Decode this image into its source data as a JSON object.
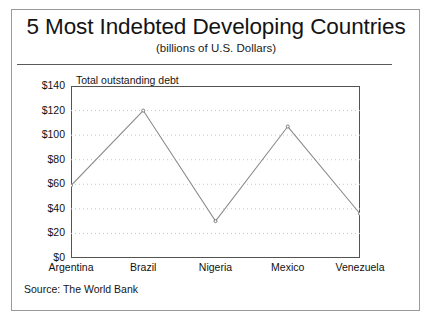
{
  "figure": {
    "title": "5 Most Indebted Developing Countries",
    "subtitle": "(billions of U.S. Dollars)",
    "series_caption": "Total outstanding debt",
    "source": "Source: The World Bank"
  },
  "colors": {
    "frame": "#9a9a9a",
    "plot_border": "#53534f",
    "line": "#8a8a8a",
    "gridline": "#c9c9c9",
    "text": "#141414",
    "background": "#ffffff"
  },
  "chart_data": {
    "type": "line",
    "title": "5 Most Indebted Developing Countries",
    "subtitle": "(billions of U.S. Dollars)",
    "xlabel": "",
    "ylabel": "",
    "series_name": "Total outstanding debt",
    "categories": [
      "Argentina",
      "Brazil",
      "Nigeria",
      "Mexico",
      "Venezuela"
    ],
    "values": [
      59,
      120,
      30,
      107,
      36
    ],
    "ylim": [
      0,
      140
    ],
    "yticks": [
      0,
      20,
      40,
      60,
      80,
      100,
      120,
      140
    ],
    "ytick_labels": [
      "$0",
      "$20",
      "$40",
      "$60",
      "$80",
      "$100",
      "$120",
      "$140"
    ],
    "grid": "horizontal-dotted",
    "legend": "none",
    "markers": true,
    "units": "billions of U.S. Dollars",
    "source": "Source: The World Bank"
  }
}
